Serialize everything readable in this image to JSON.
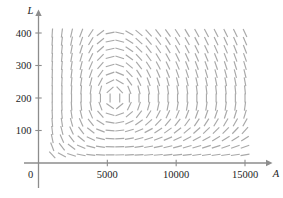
{
  "figure": {
    "kind": "slope-field",
    "background_color": "#ffffff",
    "axis_color": "#8d8d8d",
    "segment_color": "#a8a8a8",
    "label_color": "#1d1d1d"
  },
  "axes": {
    "x": {
      "name": "A",
      "origin_label": "0",
      "ticks": [
        {
          "value": 5000,
          "label": "5000"
        },
        {
          "value": 10000,
          "label": "10000"
        },
        {
          "value": 15000,
          "label": "15000"
        }
      ],
      "range": [
        0,
        16400
      ]
    },
    "y": {
      "name": "L",
      "ticks": [
        {
          "value": 100,
          "label": "100"
        },
        {
          "value": 200,
          "label": "200"
        },
        {
          "value": 300,
          "label": "300"
        },
        {
          "value": 400,
          "label": "400"
        }
      ],
      "range": [
        0,
        460
      ]
    }
  },
  "chart_data": {
    "type": "scatter",
    "title": "",
    "xlabel": "A",
    "ylabel": "L",
    "xlim": [
      0,
      16400
    ],
    "ylim": [
      0,
      460
    ],
    "grid": false,
    "legend": null,
    "equilibrium": {
      "A": 5500,
      "L": 200
    },
    "field": {
      "x_start": 1000,
      "x_step": 700,
      "x_count": 21,
      "y_start": 25,
      "y_step": 25,
      "y_count": 16,
      "segment_length_px": 9,
      "model": {
        "dA_dt": "0.05*A*(1 - L/200)",
        "dL_dt": "0.10*L*(A/5500 - 1)"
      }
    }
  }
}
